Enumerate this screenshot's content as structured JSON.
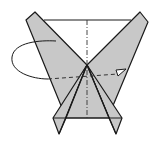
{
  "diagram": {
    "colors": {
      "paper": "#c8c8c8",
      "line": "#1a1a1a",
      "background": "#ffffff"
    },
    "annotations": {
      "fold_arrow": "turn-over / fold-behind arrow",
      "valley_fold_line": "dashed horizontal fold line",
      "mountain_fold_line": "dash-dot vertical center line"
    }
  }
}
